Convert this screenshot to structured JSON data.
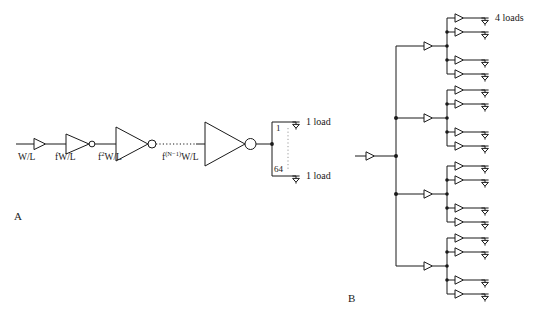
{
  "figure": {
    "background_color": "#ffffff",
    "stroke_color": "#1a1a1a",
    "panels": [
      {
        "id": "A",
        "label": "A"
      },
      {
        "id": "B",
        "label": "B"
      }
    ]
  },
  "panel_a": {
    "caption": "A",
    "type": "tapered-inverter-chain",
    "stage_labels": [
      {
        "text": "W/L",
        "base": "W/L",
        "exponent": ""
      },
      {
        "text": "fW/L",
        "base": "fW/L",
        "exponent": ""
      },
      {
        "text": "f2W/L",
        "base": "f",
        "exponent": "2",
        "suffix": "W/L"
      },
      {
        "text": "f(N-1)W/L",
        "base": "f",
        "exponent": "(N−1)",
        "suffix": "W/L"
      }
    ],
    "inverter_count": 4,
    "fanout_bracket": {
      "top_index": "1",
      "bottom_index": "64",
      "dotted_between": true
    },
    "load_labels": [
      "1 load",
      "1 load"
    ]
  },
  "panel_b": {
    "caption": "B",
    "type": "balanced-buffer-tree",
    "root_buffers": 1,
    "trunk_branches": 4,
    "leaves_per_branch": 4,
    "total_leaves": 16,
    "load_labels": [
      "4 loads"
    ]
  }
}
